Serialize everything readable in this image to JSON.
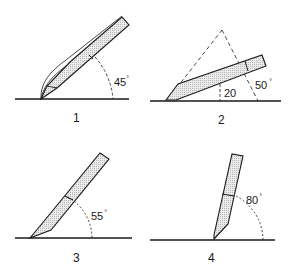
{
  "figure": {
    "panels": [
      {
        "id": "1",
        "label": "1",
        "angle_label": "45",
        "degree": "°"
      },
      {
        "id": "2",
        "label": "2",
        "angle_label_low": "20",
        "angle_label_high": "50",
        "degree": "°"
      },
      {
        "id": "3",
        "label": "3",
        "angle_label": "55",
        "degree": "°"
      },
      {
        "id": "4",
        "label": "4",
        "angle_label": "80",
        "degree": "°"
      }
    ],
    "colors": {
      "ink": "#1a1a1a",
      "blade_fill": "#d9d9d9",
      "background": "#ffffff"
    }
  }
}
